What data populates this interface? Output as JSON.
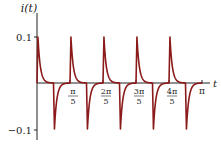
{
  "chart_data": {
    "type": "line",
    "title": "",
    "xlabel": "t",
    "ylabel": "i(t)",
    "xlim": [
      0,
      3.14159
    ],
    "ylim": [
      -0.12,
      0.12
    ],
    "grid": false,
    "legend": null,
    "x_ticks": [
      {
        "value": 0.6283,
        "label_num": "π",
        "label_den": "5"
      },
      {
        "value": 1.2566,
        "label_num": "2π",
        "label_den": "5"
      },
      {
        "value": 1.885,
        "label_num": "3π",
        "label_den": "5"
      },
      {
        "value": 2.5133,
        "label_num": "4π",
        "label_den": "5"
      },
      {
        "value": 3.1416,
        "label": "π"
      }
    ],
    "y_ticks": [
      {
        "value": 0.1,
        "label": "0.1"
      },
      {
        "value": -0.1,
        "label": "−0.1"
      }
    ],
    "series": [
      {
        "name": "i(t)",
        "color": "#8b1a1a",
        "description": "Periodic pulse train with period π/5: sharp positive spike to 0.1 at the start of each period decaying to 0, followed by a sharp negative spike to -0.1 at mid-period recovering to 0",
        "period": 0.6283,
        "peak": 0.1,
        "trough": -0.1,
        "x": [
          0,
          0.02,
          0.05,
          0.1,
          0.15,
          0.2,
          0.3,
          0.314,
          0.33,
          0.36,
          0.41,
          0.46,
          0.51,
          0.6283
        ],
        "values": [
          0,
          0.1,
          0.07,
          0.035,
          0.015,
          0.006,
          0.001,
          0,
          -0.1,
          -0.07,
          -0.035,
          -0.015,
          -0.005,
          0
        ]
      }
    ]
  },
  "axes": {
    "y_label": "i(t)",
    "x_label": "t",
    "y_tick_top": "0.1",
    "y_tick_bottom": "−0.1",
    "x_tick_pi": "π"
  }
}
